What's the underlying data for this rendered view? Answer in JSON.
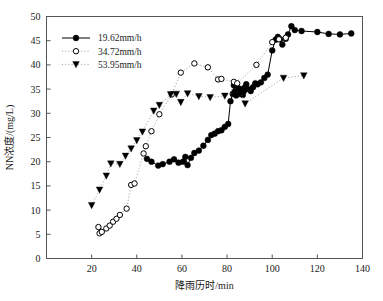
{
  "chart_data": {
    "type": "scatter",
    "title": "",
    "xlabel": "降雨历时/min",
    "ylabel": "NN浓度/(mg/L)",
    "xlim": [
      0,
      140
    ],
    "ylim": [
      0,
      50
    ],
    "xticks": [
      0,
      20,
      40,
      60,
      80,
      100,
      120,
      140
    ],
    "yticks": [
      0,
      5,
      10,
      15,
      20,
      25,
      30,
      35,
      40,
      45,
      50
    ],
    "grid": false,
    "legend_position": "upper-left",
    "series": [
      {
        "name": "19.62mm/h",
        "marker": "filled-circle",
        "line": "solid",
        "color": "#000000",
        "points": [
          [
            44.5,
            20.6
          ],
          [
            46.5,
            20.0
          ],
          [
            49.5,
            19.2
          ],
          [
            51.5,
            19.5
          ],
          [
            54.5,
            20.0
          ],
          [
            56.5,
            20.5
          ],
          [
            58.5,
            19.8
          ],
          [
            60.5,
            20.0
          ],
          [
            61.5,
            21.0
          ],
          [
            62.5,
            19.3
          ],
          [
            64.0,
            20.8
          ],
          [
            65.5,
            21.8
          ],
          [
            67.5,
            22.3
          ],
          [
            69.5,
            23.3
          ],
          [
            71.5,
            24.5
          ],
          [
            73.0,
            25.5
          ],
          [
            74.5,
            25.8
          ],
          [
            76.0,
            26.3
          ],
          [
            77.5,
            26.5
          ],
          [
            79.0,
            27.2
          ],
          [
            80.5,
            27.8
          ],
          [
            81.5,
            32.5
          ],
          [
            82.5,
            34.0
          ],
          [
            83.0,
            35.8
          ],
          [
            83.5,
            34.3
          ],
          [
            84.0,
            33.7
          ],
          [
            84.5,
            34.6
          ],
          [
            85.0,
            35.2
          ],
          [
            85.5,
            34.0
          ],
          [
            86.0,
            34.3
          ],
          [
            86.5,
            35.0
          ],
          [
            87.0,
            33.8
          ],
          [
            87.5,
            34.6
          ],
          [
            88.0,
            35.4
          ],
          [
            88.5,
            36.0
          ],
          [
            89.5,
            35.0
          ],
          [
            90.5,
            34.6
          ],
          [
            91.5,
            35.4
          ],
          [
            92.5,
            36.2
          ],
          [
            93.5,
            36.0
          ],
          [
            95.0,
            36.4
          ],
          [
            96.5,
            37.3
          ],
          [
            98.0,
            38.0
          ],
          [
            100.0,
            43.0
          ],
          [
            101.5,
            45.2
          ],
          [
            102.5,
            45.8
          ],
          [
            103.5,
            45.3
          ],
          [
            104.5,
            44.2
          ],
          [
            106.0,
            45.4
          ],
          [
            107.0,
            46.3
          ],
          [
            108.5,
            48.0
          ],
          [
            110.0,
            47.2
          ],
          [
            113.0,
            47.0
          ],
          [
            120.0,
            46.8
          ],
          [
            125.0,
            46.4
          ],
          [
            130.0,
            46.3
          ],
          [
            135.0,
            46.5
          ]
        ]
      },
      {
        "name": "34.72mm/h",
        "marker": "open-circle",
        "line": "dotted",
        "color": "#000000",
        "points": [
          [
            23.0,
            6.5
          ],
          [
            23.5,
            5.2
          ],
          [
            24.5,
            5.5
          ],
          [
            26.5,
            6.2
          ],
          [
            28.0,
            6.8
          ],
          [
            29.5,
            7.6
          ],
          [
            31.0,
            8.2
          ],
          [
            32.5,
            9.0
          ],
          [
            35.5,
            10.3
          ],
          [
            37.5,
            15.2
          ],
          [
            39.0,
            15.5
          ],
          [
            43.0,
            21.7
          ],
          [
            44.0,
            23.2
          ],
          [
            46.5,
            26.3
          ],
          [
            50.0,
            29.8
          ],
          [
            55.5,
            33.9
          ],
          [
            59.5,
            38.4
          ],
          [
            65.5,
            40.3
          ],
          [
            71.5,
            39.5
          ],
          [
            76.0,
            37.0
          ],
          [
            77.5,
            37.1
          ],
          [
            83.0,
            36.5
          ],
          [
            84.5,
            36.2
          ],
          [
            93.0,
            40.0
          ],
          [
            100.0,
            44.7
          ],
          [
            103.0,
            45.3
          ],
          [
            106.0,
            45.6
          ]
        ]
      },
      {
        "name": "53.95mm/h",
        "marker": "filled-triangle-down",
        "line": "dotted",
        "color": "#000000",
        "points": [
          [
            20.0,
            11.0
          ],
          [
            23.5,
            14.2
          ],
          [
            26.5,
            17.1
          ],
          [
            28.5,
            19.6
          ],
          [
            32.5,
            19.5
          ],
          [
            35.0,
            21.2
          ],
          [
            37.5,
            22.7
          ],
          [
            40.0,
            24.4
          ],
          [
            42.5,
            26.2
          ],
          [
            47.5,
            30.5
          ],
          [
            50.0,
            31.7
          ],
          [
            55.0,
            33.9
          ],
          [
            57.5,
            34.0
          ],
          [
            59.5,
            32.3
          ],
          [
            62.5,
            34.1
          ],
          [
            67.5,
            33.5
          ],
          [
            72.5,
            33.3
          ],
          [
            79.0,
            33.6
          ],
          [
            83.5,
            34.3
          ],
          [
            86.0,
            34.3
          ],
          [
            88.0,
            32.0
          ],
          [
            105.0,
            37.3
          ],
          [
            114.0,
            37.8
          ]
        ]
      }
    ]
  },
  "legend": {
    "items": [
      {
        "label": "19.62mm/h"
      },
      {
        "label": "34.72mm/h"
      },
      {
        "label": "53.95mm/h"
      }
    ]
  },
  "axes": {
    "x_title": "降雨历时/min",
    "y_title": "NN浓度/(mg/L)",
    "x_tick_labels": [
      "0",
      "20",
      "40",
      "60",
      "80",
      "100",
      "120",
      "140"
    ],
    "y_tick_labels": [
      "0",
      "5",
      "10",
      "15",
      "20",
      "25",
      "30",
      "35",
      "40",
      "45",
      "50"
    ]
  }
}
